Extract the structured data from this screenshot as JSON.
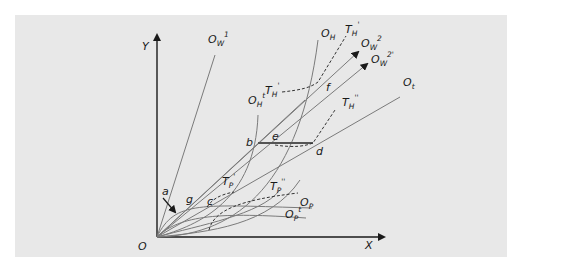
{
  "diagram": {
    "type": "edgeworth-box-production-expansion",
    "axes": {
      "x_label": "X",
      "y_label": "Y",
      "origin_label": "O"
    },
    "points": [
      "a",
      "b",
      "c",
      "d",
      "e",
      "f",
      "g"
    ],
    "rays": [
      {
        "id": "OW1",
        "base": "O",
        "sub": "W",
        "sup": "1"
      },
      {
        "id": "OW2",
        "base": "O",
        "sub": "W",
        "sup": "2"
      },
      {
        "id": "OW2prime",
        "base": "O",
        "sub": "W",
        "sup": "2'"
      },
      {
        "id": "Ot",
        "base": "O",
        "sub": "t",
        "sup": ""
      }
    ],
    "curves": [
      {
        "id": "OH",
        "base": "O",
        "sub": "H",
        "sup": ""
      },
      {
        "id": "OHt",
        "base": "O",
        "sub": "H",
        "sup": "t"
      },
      {
        "id": "OP",
        "base": "O",
        "sub": "P",
        "sup": ""
      },
      {
        "id": "OPt",
        "base": "O",
        "sub": "P",
        "sup": "t"
      }
    ],
    "dashed_curves": [
      {
        "id": "TH1",
        "base": "T",
        "sub": "H",
        "sup": "'"
      },
      {
        "id": "TH1b",
        "base": "T",
        "sub": "H",
        "sup": "'"
      },
      {
        "id": "TH2",
        "base": "T",
        "sub": "H",
        "sup": "''"
      },
      {
        "id": "TP1",
        "base": "T",
        "sub": "P",
        "sup": "'"
      },
      {
        "id": "TP2",
        "base": "T",
        "sub": "P",
        "sup": "''"
      }
    ]
  },
  "colors": {
    "panel": "#e8e8e8",
    "line": "#7a7a7a",
    "axis": "#1a1a1a",
    "bold": "#555555"
  }
}
